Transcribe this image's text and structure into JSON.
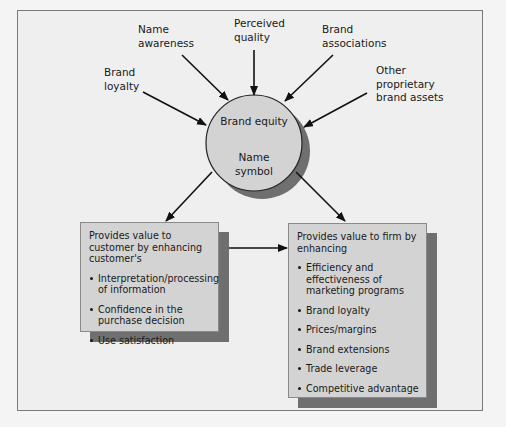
{
  "diagram": {
    "center": {
      "title": "Brand equity",
      "subtitle_lines": [
        "Name",
        "symbol"
      ]
    },
    "inputs": [
      {
        "id": "brand-loyalty",
        "lines": [
          "Brand",
          "loyalty"
        ]
      },
      {
        "id": "name-awareness",
        "lines": [
          "Name",
          "awareness"
        ]
      },
      {
        "id": "perceived-quality",
        "lines": [
          "Perceived",
          "quality"
        ]
      },
      {
        "id": "brand-associations",
        "lines": [
          "Brand",
          "associations"
        ]
      },
      {
        "id": "other-proprietary-brand-assets",
        "lines": [
          "Other",
          "proprietary",
          "brand assets"
        ]
      }
    ],
    "outputs": {
      "customer": {
        "intro": "Provides value to customer by enhancing customer's",
        "items": [
          "Interpretation/processing of information",
          "Confidence in the purchase decision",
          "Use satisfaction"
        ]
      },
      "firm": {
        "intro": "Provides value to firm by enhancing",
        "items": [
          "Efficiency and effectiveness of marketing programs",
          "Brand loyalty",
          "Prices/margins",
          "Brand extensions",
          "Trade leverage",
          "Competitive advantage"
        ]
      }
    },
    "colors": {
      "background": "#efefef",
      "circle_fill": "#d3d3d3",
      "box_fill": "#d3d3d3",
      "shadow": "#6f6f6f",
      "arrow": "#111111"
    }
  }
}
